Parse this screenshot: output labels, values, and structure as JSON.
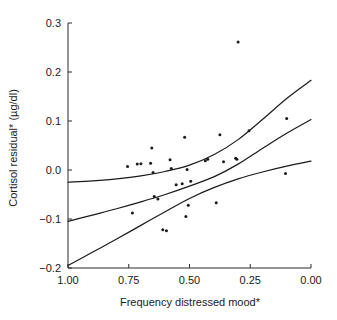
{
  "chart_data": {
    "type": "scatter",
    "title": "",
    "subtitle": "",
    "xlabel": "Frequency distressed mood*",
    "ylabel": "Cortisol residual* (µg/dl)",
    "xlim": [
      1.0,
      0.0
    ],
    "ylim": [
      -0.2,
      0.3
    ],
    "x_reversed": true,
    "grid": false,
    "legend": null,
    "legend_position": "none",
    "xticks": [
      "1.00",
      "0.75",
      "0.50",
      "0.25",
      "0.00"
    ],
    "xtick_values": [
      1.0,
      0.75,
      0.5,
      0.25,
      0.0
    ],
    "yticks": [
      "0.3",
      "0.2",
      "0.1",
      "0.0",
      "−0.1",
      "−0.2"
    ],
    "ytick_values": [
      0.3,
      0.2,
      0.1,
      0.0,
      -0.1,
      -0.2
    ],
    "points": [
      {
        "x": 0.755,
        "y": 0.007
      },
      {
        "x": 0.735,
        "y": -0.088
      },
      {
        "x": 0.715,
        "y": 0.012
      },
      {
        "x": 0.7,
        "y": 0.013
      },
      {
        "x": 0.66,
        "y": 0.014
      },
      {
        "x": 0.655,
        "y": 0.045
      },
      {
        "x": 0.65,
        "y": -0.005
      },
      {
        "x": 0.645,
        "y": -0.054
      },
      {
        "x": 0.63,
        "y": -0.059
      },
      {
        "x": 0.61,
        "y": -0.122
      },
      {
        "x": 0.595,
        "y": -0.124
      },
      {
        "x": 0.58,
        "y": 0.021
      },
      {
        "x": 0.575,
        "y": 0.003
      },
      {
        "x": 0.555,
        "y": -0.03
      },
      {
        "x": 0.53,
        "y": -0.028
      },
      {
        "x": 0.52,
        "y": 0.067
      },
      {
        "x": 0.515,
        "y": -0.095
      },
      {
        "x": 0.51,
        "y": 0.001
      },
      {
        "x": 0.505,
        "y": -0.072
      },
      {
        "x": 0.495,
        "y": -0.023
      },
      {
        "x": 0.435,
        "y": 0.019
      },
      {
        "x": 0.425,
        "y": 0.022
      },
      {
        "x": 0.39,
        "y": -0.067
      },
      {
        "x": 0.375,
        "y": 0.072
      },
      {
        "x": 0.36,
        "y": 0.017
      },
      {
        "x": 0.31,
        "y": 0.024
      },
      {
        "x": 0.305,
        "y": 0.022
      },
      {
        "x": 0.3,
        "y": 0.261
      },
      {
        "x": 0.255,
        "y": 0.08
      },
      {
        "x": 0.1,
        "y": 0.105
      },
      {
        "x": 0.105,
        "y": -0.007
      }
    ],
    "curves": [
      {
        "name": "upper confidence band",
        "points": [
          {
            "x": 1.0,
            "y": -0.025
          },
          {
            "x": 0.9,
            "y": -0.022
          },
          {
            "x": 0.8,
            "y": -0.018
          },
          {
            "x": 0.7,
            "y": -0.012
          },
          {
            "x": 0.6,
            "y": -0.003
          },
          {
            "x": 0.5,
            "y": 0.01
          },
          {
            "x": 0.4,
            "y": 0.031
          },
          {
            "x": 0.3,
            "y": 0.062
          },
          {
            "x": 0.2,
            "y": 0.103
          },
          {
            "x": 0.1,
            "y": 0.146
          },
          {
            "x": 0.0,
            "y": 0.183
          }
        ]
      },
      {
        "name": "fitted regression line",
        "points": [
          {
            "x": 1.0,
            "y": -0.105
          },
          {
            "x": 0.9,
            "y": -0.092
          },
          {
            "x": 0.8,
            "y": -0.079
          },
          {
            "x": 0.7,
            "y": -0.065
          },
          {
            "x": 0.6,
            "y": -0.05
          },
          {
            "x": 0.5,
            "y": -0.033
          },
          {
            "x": 0.4,
            "y": -0.014
          },
          {
            "x": 0.3,
            "y": 0.012
          },
          {
            "x": 0.2,
            "y": 0.044
          },
          {
            "x": 0.1,
            "y": 0.075
          },
          {
            "x": 0.0,
            "y": 0.103
          }
        ]
      },
      {
        "name": "lower confidence band",
        "points": [
          {
            "x": 1.0,
            "y": -0.195
          },
          {
            "x": 0.9,
            "y": -0.168
          },
          {
            "x": 0.8,
            "y": -0.141
          },
          {
            "x": 0.7,
            "y": -0.113
          },
          {
            "x": 0.6,
            "y": -0.085
          },
          {
            "x": 0.5,
            "y": -0.058
          },
          {
            "x": 0.4,
            "y": -0.036
          },
          {
            "x": 0.3,
            "y": -0.018
          },
          {
            "x": 0.2,
            "y": -0.004
          },
          {
            "x": 0.1,
            "y": 0.008
          },
          {
            "x": 0.0,
            "y": 0.018
          }
        ]
      }
    ],
    "annotations": [],
    "colors": {
      "point": "#1a1a1a",
      "curve": "#1a1a1a",
      "axis": "#2b2b2b",
      "background": "#ffffff"
    }
  }
}
